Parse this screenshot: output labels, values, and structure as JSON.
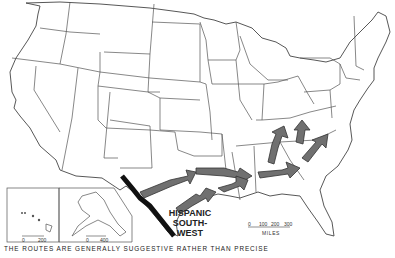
{
  "map": {
    "subject": "Routes from the Hispanic Southwest",
    "region_label_lines": [
      "HISPANIC",
      "SOUTH-",
      "WEST"
    ],
    "caption": "THE ROUTES ARE GENERALLY SUGGESTIVE RATHER THAN PRECISE",
    "main_scale": {
      "ticks": [
        "0",
        "100",
        "200",
        "300"
      ],
      "unit": "MILES"
    },
    "hawaii_scale": {
      "ticks": [
        "0",
        "200"
      ]
    },
    "alaska_scale": {
      "ticks": [
        "0",
        "400"
      ]
    },
    "arrow_count": 7,
    "colors": {
      "arrow_fill": "#707070",
      "border": "#111111",
      "lines": "#555555"
    }
  }
}
